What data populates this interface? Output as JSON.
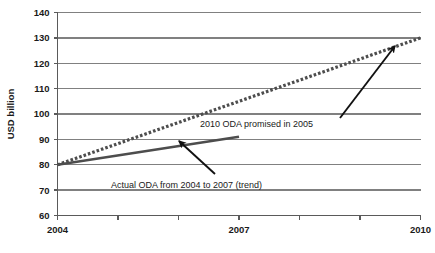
{
  "chart_data": {
    "type": "line",
    "title": "",
    "xlabel": "",
    "ylabel": "USD billion",
    "xlim": [
      2004,
      2010
    ],
    "ylim": [
      60,
      140
    ],
    "grid": true,
    "legend_position": "none",
    "y_ticks": [
      60,
      70,
      80,
      90,
      100,
      110,
      120,
      130,
      140
    ],
    "y_tick_labels": [
      "60",
      "70",
      "80",
      "90",
      "100",
      "110",
      "120",
      "130",
      "140"
    ],
    "x_ticks": [
      2004,
      2005,
      2006,
      2007,
      2008,
      2009,
      2010
    ],
    "x_tick_labels": [
      "2004",
      "",
      "",
      "2007",
      "",
      "",
      "2010"
    ],
    "x_visible_labels": [
      {
        "value": 2004,
        "label": "2004"
      },
      {
        "value": 2007,
        "label": "2007"
      },
      {
        "value": 2010,
        "label": "2010"
      }
    ],
    "series": [
      {
        "name": "2010 ODA promised in 2005",
        "style": "dotted",
        "color": "#4d4d4d",
        "x": [
          2004,
          2010
        ],
        "values": [
          80,
          130
        ]
      },
      {
        "name": "Actual ODA from 2004 to 2007 (trend)",
        "style": "solid",
        "color": "#4d4d4d",
        "x": [
          2004,
          2007
        ],
        "values": [
          80,
          91
        ]
      }
    ],
    "annotations": [
      {
        "text": "2010 ODA promised in 2005",
        "text_x": 200,
        "text_y": 127,
        "arrow_from_x": 340,
        "arrow_from_y": 118,
        "arrow_to_x": 395,
        "arrow_to_y": 46
      },
      {
        "text": "Actual ODA from 2004 to 2007 (trend)",
        "text_x": 111,
        "text_y": 188,
        "arrow_from_x": 215,
        "arrow_from_y": 174,
        "arrow_to_x": 179,
        "arrow_to_y": 141
      }
    ]
  },
  "axes": {
    "y_title": "USD billion"
  }
}
